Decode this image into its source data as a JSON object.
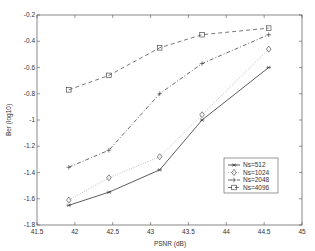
{
  "chart_data": {
    "type": "line",
    "title": "",
    "xlabel": "PSNR (dB)",
    "ylabel": "Ber (log10)",
    "xlim": [
      41.5,
      45
    ],
    "ylim": [
      -1.8,
      -0.2
    ],
    "xticks": [
      "41.5",
      "42",
      "42.5",
      "43",
      "43.5",
      "44",
      "44.5",
      "45"
    ],
    "yticks": [
      "-0.2",
      "-0.4",
      "-0.6",
      "-0.8",
      "-1",
      "-1.2",
      "-1.4",
      "-1.6",
      "-1.8"
    ],
    "grid": false,
    "legend_position": "lower right",
    "x": [
      41.92,
      42.45,
      43.12,
      43.68,
      44.56
    ],
    "series": [
      {
        "name": "Ns=512",
        "marker": "star",
        "line": "solid",
        "values": [
          -1.65,
          -1.55,
          -1.38,
          -1.0,
          -0.6
        ]
      },
      {
        "name": "Ns=1024",
        "marker": "diamond",
        "line": "dotted",
        "values": [
          -1.61,
          -1.44,
          -1.28,
          -0.96,
          -0.46
        ]
      },
      {
        "name": "Ns=2048",
        "marker": "plus",
        "line": "dashdot",
        "values": [
          -1.36,
          -1.23,
          -0.8,
          -0.57,
          -0.35
        ]
      },
      {
        "name": "Ns=4096",
        "marker": "square",
        "line": "dashed",
        "values": [
          -0.77,
          -0.66,
          -0.45,
          -0.35,
          -0.3
        ]
      }
    ]
  }
}
